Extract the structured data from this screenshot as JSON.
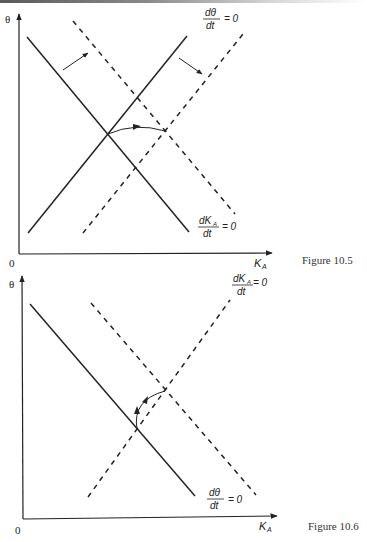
{
  "figures": [
    {
      "caption": "Figure 10.5",
      "y_axis_label": "θ",
      "x_axis_label": "K",
      "x_axis_subscript": "A",
      "origin_label": "0",
      "labels": {
        "theta_nullcline": {
          "num": "dθ",
          "den": "dt",
          "rhs": "= 0"
        },
        "k_nullcline": {
          "num": "dK",
          "num_sub": "A",
          "den": "dt",
          "rhs": "= 0"
        }
      },
      "description": "Both nullclines shift right: solid dθ/dt=0 (upward) and dK_A/dt=0 (downward) lines shift to dashed positions; equilibrium moves right along a curved path."
    },
    {
      "caption": "Figure 10.6",
      "y_axis_label": "θ",
      "x_axis_label": "K",
      "x_axis_subscript": "A",
      "origin_label": "0",
      "labels": {
        "k_nullcline": {
          "num": "dK",
          "num_sub": "A",
          "den": "dt",
          "rhs": "= 0"
        },
        "theta_nullcline": {
          "num": "dθ",
          "den": "dt",
          "rhs": "= 0"
        }
      },
      "description": "Downward solid line dθ/dt=0; dashed dK_A/dt=0 pair intersecting; equilibrium path curves up and right."
    }
  ],
  "colors": {
    "line": "#222222",
    "background": "#ffffff"
  }
}
